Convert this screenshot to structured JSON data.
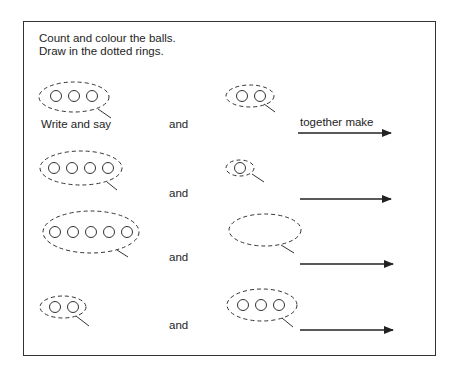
{
  "worksheet": {
    "instructions": [
      "Count and colour the balls.",
      "Draw in the dotted rings."
    ],
    "write_and_say": "Write and say",
    "together_make": "together make",
    "rows": [
      {
        "left_balls": 3,
        "connector": "and",
        "right_balls": 2
      },
      {
        "left_balls": 4,
        "connector": "and",
        "right_balls": 1
      },
      {
        "left_balls": 5,
        "connector": "and",
        "right_balls": 0
      },
      {
        "left_balls": 2,
        "connector": "and",
        "right_balls": 3
      }
    ]
  },
  "colors": {
    "ink": "#222222",
    "frame": "#333333",
    "background": "#ffffff"
  }
}
